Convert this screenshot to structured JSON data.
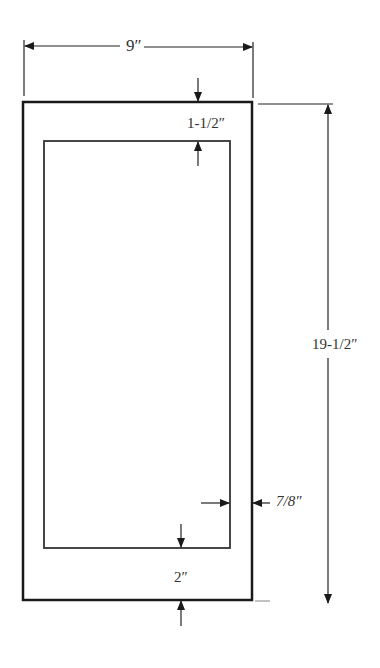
{
  "diagram": {
    "type": "dimensioned frame drawing",
    "dimensions": {
      "width": "9″",
      "height": "19-1/2″",
      "top_margin": "1-1/2″",
      "side_margin": "7/8″",
      "bottom_margin": "2″"
    },
    "colors": {
      "line": "#1a1a1a",
      "background": "#ffffff"
    }
  }
}
